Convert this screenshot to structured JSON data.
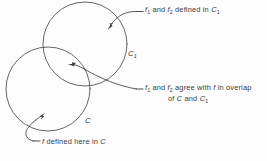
{
  "figure": {
    "type": "venn-diagram",
    "background_color": "#fdfdfd",
    "stroke_color": "#4a4a4a",
    "text_color": "#3a3a3a",
    "circles": [
      {
        "id": "upper-circle",
        "label": "C",
        "label_subscript": "1",
        "center_x": 85,
        "center_y": 44,
        "radius": 42
      },
      {
        "id": "lower-circle",
        "label": "C",
        "label_subscript": "",
        "center_x": 48,
        "center_y": 89,
        "radius": 42
      }
    ],
    "annotations": [
      {
        "id": "note-top",
        "text_parts": [
          "f",
          "1",
          " and ",
          "f",
          "2",
          " defined in ",
          "C",
          "1"
        ],
        "plain": "f1 and f2 defined in C1",
        "target": "upper-circle-interior"
      },
      {
        "id": "note-middle",
        "line1_plain": "f1 and f2 agree with f in overlap",
        "line2_plain": "of C and C1",
        "target": "overlap-region"
      },
      {
        "id": "note-bottom",
        "plain": "f defined here in C",
        "target": "lower-circle-interior"
      }
    ],
    "labels": {
      "upper_circle_name": "C",
      "upper_circle_sub": "1",
      "lower_circle_name": "C"
    },
    "text": {
      "f_symbol": "f",
      "sub_one": "1",
      "sub_two": "2",
      "and": " and ",
      "defined_in": " defined in ",
      "agree_with": " agree with ",
      "in_overlap": " in overlap",
      "of_word": "of ",
      "and_plain": " and ",
      "f_defined_here_in": " defined  here  in ",
      "C": "C",
      "C1_sub": "1"
    }
  }
}
